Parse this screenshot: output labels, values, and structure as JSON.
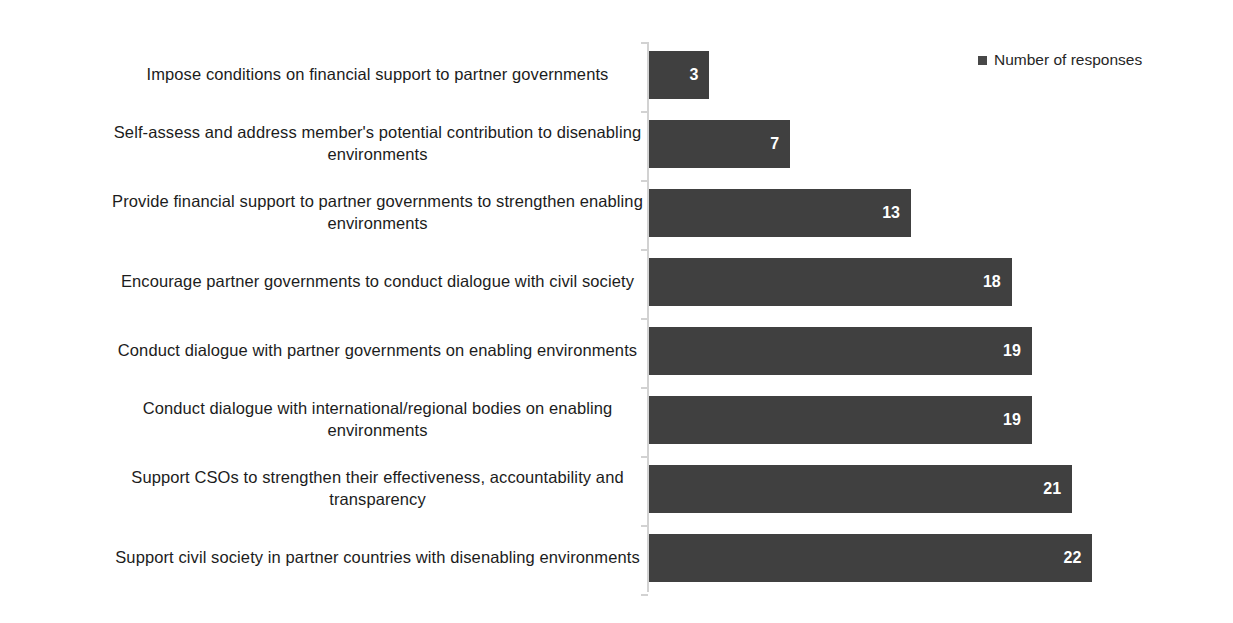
{
  "chart_data": {
    "type": "bar",
    "orientation": "horizontal",
    "title": "",
    "subtitle": "",
    "xlabel": "",
    "ylabel": "",
    "grid": false,
    "legend_position": "top-right",
    "xlim": [
      0,
      22
    ],
    "bar_color": "#404040",
    "value_label_color": "#ffffff",
    "axis_line_color": "#d2d2d2",
    "background_color": "#ffffff",
    "categories": [
      "Impose conditions on financial support to partner governments",
      "Self-assess and address member's potential contribution to disenabling environments",
      "Provide financial support to partner governments to strengthen enabling environments",
      "Encourage partner governments to conduct dialogue with civil society",
      "Conduct dialogue with partner governments on enabling environments",
      "Conduct dialogue with international/regional bodies on enabling environments",
      "Support CSOs to strengthen their effectiveness, accountability and transparency",
      "Support civil society in partner countries with disenabling environments"
    ],
    "values": [
      3,
      7,
      13,
      18,
      19,
      19,
      21,
      22
    ],
    "series": [
      {
        "name": "Number of responses",
        "values": [
          3,
          7,
          13,
          18,
          19,
          19,
          21,
          22
        ]
      }
    ]
  },
  "legend": {
    "entries": [
      {
        "label": "Number of responses",
        "color": "#484848"
      }
    ]
  },
  "rows": [
    {
      "label": "Impose conditions on financial support to partner governments",
      "value": 3,
      "value_text": "3"
    },
    {
      "label": "Self-assess and address member's potential contribution to disenabling environments",
      "value": 7,
      "value_text": "7"
    },
    {
      "label": "Provide financial support to partner governments to strengthen enabling environments",
      "value": 13,
      "value_text": "13"
    },
    {
      "label": "Encourage partner governments to conduct dialogue with civil society",
      "value": 18,
      "value_text": "18"
    },
    {
      "label": "Conduct dialogue with partner governments on enabling environments",
      "value": 19,
      "value_text": "19"
    },
    {
      "label": "Conduct dialogue with international/regional bodies on enabling environments",
      "value": 19,
      "value_text": "19"
    },
    {
      "label": "Support CSOs to strengthen their effectiveness, accountability and transparency",
      "value": 21,
      "value_text": "21"
    },
    {
      "label": "Support civil society in partner countries with disenabling environments",
      "value": 22,
      "value_text": "22"
    }
  ]
}
